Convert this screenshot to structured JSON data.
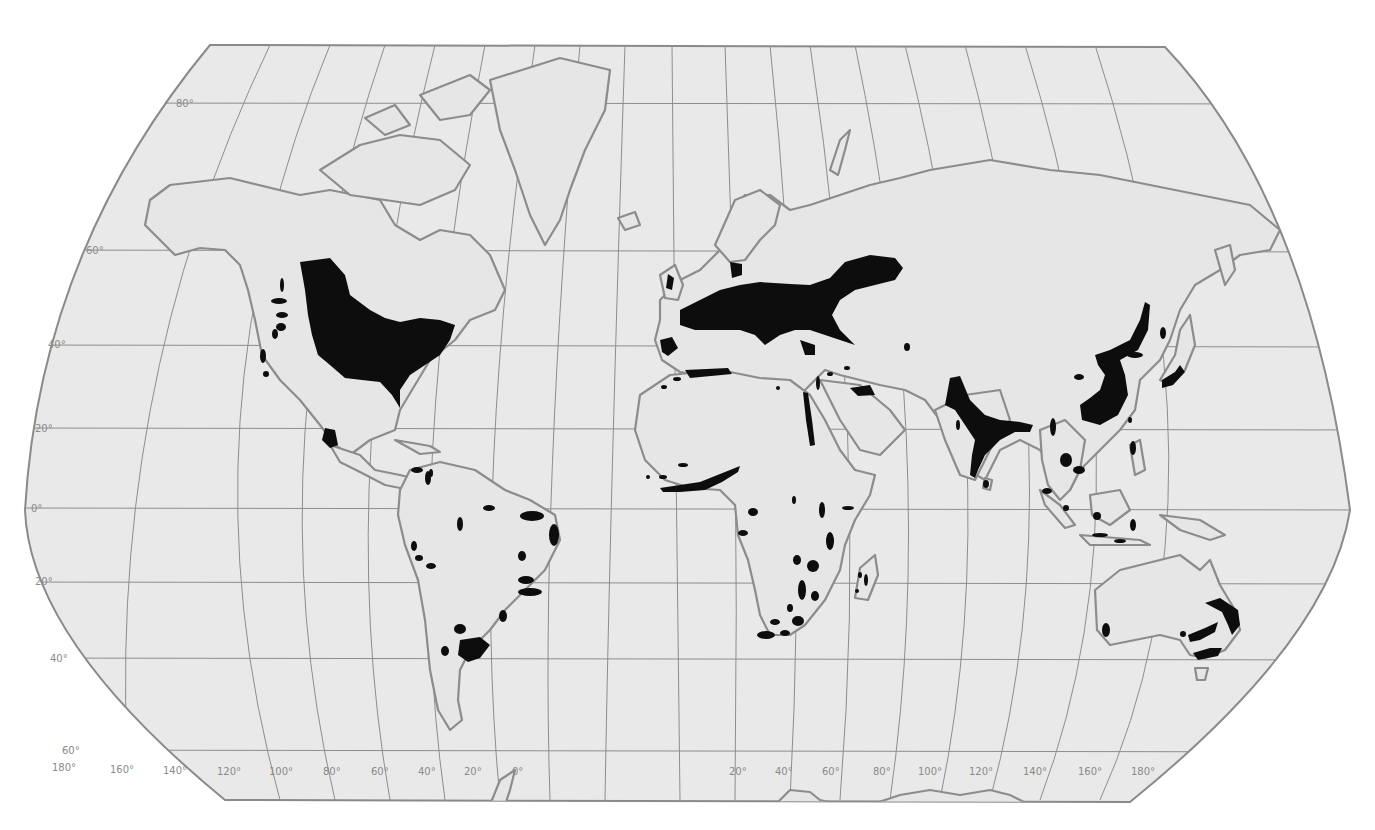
{
  "map": {
    "projection": "world map with curved meridians",
    "colors": {
      "background": "#ffffff",
      "map_fill": "#e9e9e9",
      "coastline": "#8c8c8c",
      "graticule": "#8d8d8d",
      "shaded_region": "#0d0d0d",
      "label": "#8a8a8a"
    },
    "latitude_labels": [
      {
        "id": "lat80",
        "text": "80°"
      },
      {
        "id": "lat60",
        "text": "60°"
      },
      {
        "id": "lat40",
        "text": "40°"
      },
      {
        "id": "lat20",
        "text": "20°"
      },
      {
        "id": "lat0",
        "text": "0°"
      },
      {
        "id": "latS20",
        "text": "20°"
      },
      {
        "id": "latS40",
        "text": "40°"
      },
      {
        "id": "latS60",
        "text": "60°"
      }
    ],
    "longitude_labels": [
      {
        "id": "lon180w",
        "text": "180°"
      },
      {
        "id": "lon160w",
        "text": "160°"
      },
      {
        "id": "lon140w",
        "text": "140°"
      },
      {
        "id": "lon120w",
        "text": "120°"
      },
      {
        "id": "lon100w",
        "text": "100°"
      },
      {
        "id": "lon80w",
        "text": "80°"
      },
      {
        "id": "lon60w",
        "text": "60°"
      },
      {
        "id": "lon40w",
        "text": "40°"
      },
      {
        "id": "lon20w",
        "text": "20°"
      },
      {
        "id": "lon0",
        "text": "0°"
      },
      {
        "id": "lon20e",
        "text": "20°"
      },
      {
        "id": "lon40e",
        "text": "40°"
      },
      {
        "id": "lon60e",
        "text": "60°"
      },
      {
        "id": "lon80e",
        "text": "80°"
      },
      {
        "id": "lon100e",
        "text": "100°"
      },
      {
        "id": "lon120e",
        "text": "120°"
      },
      {
        "id": "lon140e",
        "text": "140°"
      },
      {
        "id": "lon160e",
        "text": "160°"
      },
      {
        "id": "lon180e",
        "text": "180°"
      }
    ],
    "shaded_regions": [
      "North America: central and eastern US and Canada prairies",
      "North America: western mountain patches",
      "Mexico: central highlands",
      "Central America / northern South America: small patches",
      "South America: eastern Brazil coast, Andes patches, Pampas (Argentina/Uruguay)",
      "Europe: western and central Europe to western Russia",
      "Iberian peninsula patch",
      "North Africa: Maghreb coast",
      "Nile valley",
      "West Africa: Gulf of Guinea coast",
      "East and southern Africa: highland patches",
      "Madagascar: small patches",
      "South Asia: Indus-Ganges plains and Deccan",
      "East Asia: eastern China, Korea, Manchuria",
      "Japan",
      "Southeast Asia: Indochina and Indonesia patches",
      "Australia: southeast and southwest"
    ]
  }
}
